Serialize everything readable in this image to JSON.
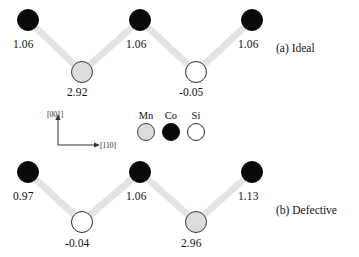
{
  "figure": {
    "panels": [
      {
        "id": "ideal",
        "label": "(a) Ideal",
        "label_x": 276,
        "label_y": 42,
        "atoms": [
          {
            "element": "Co",
            "species_key": "co",
            "cx": 28,
            "cy": 20,
            "r": 11,
            "value": "1.06",
            "vx": 13,
            "vy": 38
          },
          {
            "element": "Mn",
            "species_key": "mn",
            "cx": 82,
            "cy": 72,
            "r": 11,
            "value": "2.92",
            "vx": 67,
            "vy": 86
          },
          {
            "element": "Co",
            "species_key": "co",
            "cx": 140,
            "cy": 20,
            "r": 11,
            "value": "1.06",
            "vx": 126,
            "vy": 38
          },
          {
            "element": "Si",
            "species_key": "si",
            "cx": 196,
            "cy": 72,
            "r": 11,
            "value": "-0.05",
            "vx": 179,
            "vy": 86
          },
          {
            "element": "Co",
            "species_key": "co",
            "cx": 252,
            "cy": 20,
            "r": 11,
            "value": "1.06",
            "vx": 238,
            "vy": 38
          }
        ],
        "bonds": [
          {
            "from": 0,
            "to": 1
          },
          {
            "from": 1,
            "to": 2
          },
          {
            "from": 2,
            "to": 3
          },
          {
            "from": 3,
            "to": 4
          }
        ]
      },
      {
        "id": "defective",
        "label": "(b) Defective",
        "label_x": 276,
        "label_y": 204,
        "atoms": [
          {
            "element": "Co",
            "species_key": "co",
            "cx": 28,
            "cy": 172,
            "r": 11,
            "value": "0.97",
            "vx": 13,
            "vy": 190
          },
          {
            "element": "Si",
            "species_key": "si",
            "cx": 82,
            "cy": 222,
            "r": 11,
            "value": "-0.04",
            "vx": 65,
            "vy": 237
          },
          {
            "element": "Co",
            "species_key": "co",
            "cx": 140,
            "cy": 172,
            "r": 11,
            "value": "1.06",
            "vx": 126,
            "vy": 190
          },
          {
            "element": "Mn",
            "species_key": "mn",
            "cx": 196,
            "cy": 222,
            "r": 11,
            "value": "2.96",
            "vx": 181,
            "vy": 237
          },
          {
            "element": "Co",
            "species_key": "co",
            "cx": 252,
            "cy": 172,
            "r": 11,
            "value": "1.13",
            "vx": 238,
            "vy": 190
          }
        ],
        "bonds": [
          {
            "from": 0,
            "to": 1
          },
          {
            "from": 1,
            "to": 2
          },
          {
            "from": 2,
            "to": 3
          },
          {
            "from": 3,
            "to": 4
          }
        ]
      }
    ],
    "legend": {
      "items": [
        {
          "label": "Mn",
          "species_key": "mn",
          "cx": 146,
          "cy": 132,
          "r": 9,
          "label_x": 146,
          "label_y": 110
        },
        {
          "label": "Co",
          "species_key": "co",
          "cx": 171,
          "cy": 132,
          "r": 9,
          "label_x": 171,
          "label_y": 110
        },
        {
          "label": "Si",
          "species_key": "si",
          "cx": 196,
          "cy": 132,
          "r": 9,
          "label_x": 196,
          "label_y": 110
        }
      ]
    },
    "axes": {
      "origin_x": 58,
      "origin_y": 145,
      "vertical_label": "[001]",
      "vertical_label_x": 47,
      "vertical_label_y": 110,
      "vertical_tip_y": 118,
      "horizontal_label": "[110]",
      "horizontal_label_x": 100,
      "horizontal_label_y": 141,
      "horizontal_tip_x": 96
    },
    "style": {
      "bond_color": "#e3e3e3",
      "bond_width": 7,
      "co_color": "#0a0a0a",
      "mn_color": "#dcdcdc",
      "si_color": "#ffffff",
      "outline_color": "#2a2a2a",
      "background": "#ffffff",
      "axis_color": "#333333"
    }
  }
}
